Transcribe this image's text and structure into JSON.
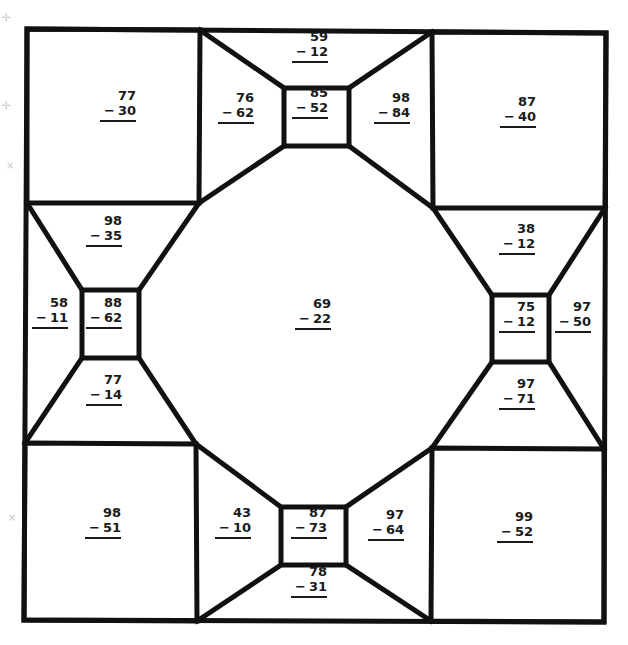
{
  "worksheet": {
    "type": "subtraction color-by-number quilt",
    "operator": "−",
    "problems": [
      {
        "id": "tl-square",
        "top": "77",
        "bottom": "30",
        "x": 118,
        "y": 96
      },
      {
        "id": "top-left-trap",
        "top": "76",
        "bottom": "62",
        "x": 236,
        "y": 98
      },
      {
        "id": "top-outer-trap",
        "top": "59",
        "bottom": "12",
        "x": 310,
        "y": 37
      },
      {
        "id": "top-center-box",
        "top": "85",
        "bottom": "52",
        "x": 310,
        "y": 93
      },
      {
        "id": "top-right-trap",
        "top": "98",
        "bottom": "84",
        "x": 392,
        "y": 98
      },
      {
        "id": "tr-square",
        "top": "87",
        "bottom": "40",
        "x": 518,
        "y": 102
      },
      {
        "id": "left-top-trap",
        "top": "98",
        "bottom": "35",
        "x": 104,
        "y": 221
      },
      {
        "id": "left-outer-trap",
        "top": "58",
        "bottom": "11",
        "x": 50,
        "y": 303
      },
      {
        "id": "left-center-box",
        "top": "88",
        "bottom": "62",
        "x": 104,
        "y": 303
      },
      {
        "id": "left-bottom-trap",
        "top": "77",
        "bottom": "14",
        "x": 104,
        "y": 380
      },
      {
        "id": "center-octagon",
        "top": "69",
        "bottom": "22",
        "x": 313,
        "y": 304
      },
      {
        "id": "right-top-trap",
        "top": "38",
        "bottom": "12",
        "x": 517,
        "y": 229
      },
      {
        "id": "right-center-box",
        "top": "75",
        "bottom": "12",
        "x": 517,
        "y": 307
      },
      {
        "id": "right-outer-trap",
        "top": "97",
        "bottom": "50",
        "x": 573,
        "y": 307
      },
      {
        "id": "right-bottom-trap",
        "top": "97",
        "bottom": "71",
        "x": 517,
        "y": 384
      },
      {
        "id": "bl-square",
        "top": "98",
        "bottom": "51",
        "x": 103,
        "y": 513
      },
      {
        "id": "bottom-left-trap",
        "top": "43",
        "bottom": "10",
        "x": 233,
        "y": 513
      },
      {
        "id": "bottom-center-box",
        "top": "87",
        "bottom": "73",
        "x": 309,
        "y": 513
      },
      {
        "id": "bottom-outer-trap",
        "top": "78",
        "bottom": "31",
        "x": 309,
        "y": 572
      },
      {
        "id": "bottom-right-trap",
        "top": "97",
        "bottom": "64",
        "x": 386,
        "y": 515
      },
      {
        "id": "br-square",
        "top": "99",
        "bottom": "52",
        "x": 515,
        "y": 517
      }
    ]
  },
  "colors": {
    "line": "#111111",
    "background": "#ffffff",
    "text": "#1a1a1a"
  }
}
